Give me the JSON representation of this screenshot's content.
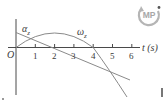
{
  "figure": {
    "origin_label": "O",
    "x_axis_label": "t (s)",
    "x_ticks": [
      "1",
      "2",
      "3",
      "4",
      "5",
      "6"
    ],
    "curve_labels": {
      "alpha": "αz",
      "omega": "ωz"
    },
    "badge": {
      "icon": "mastering-physics-badge-icon",
      "text": "MP"
    },
    "colors": {
      "axes": "#4a4a4a",
      "curves": "#8a8a8a",
      "badge": "#a8a8a8"
    }
  },
  "chart_data": {
    "type": "line",
    "title": "",
    "xlabel": "t (s)",
    "ylabel": "",
    "xlim": [
      0,
      6.5
    ],
    "grid": false,
    "x_ticks": [
      1,
      2,
      3,
      4,
      5,
      6
    ],
    "series": [
      {
        "name": "αz",
        "shape": "straight line, decreasing",
        "x": [
          0,
          2.2,
          6
        ],
        "values": [
          1,
          0,
          -2.4
        ],
        "note": "relative units; crosses t-axis near t≈2.2 s"
      },
      {
        "name": "ωz",
        "shape": "parabola opening downward",
        "x": [
          0,
          1,
          2,
          3,
          4,
          5,
          6
        ],
        "values": [
          0,
          0.75,
          1,
          0.75,
          0,
          -1.25,
          -3
        ],
        "note": "relative units; zero at t=0 and t=4 s, maximum at t=2 s"
      }
    ],
    "annotations": [
      "O at origin",
      "αz label near t≈0.8",
      "ωz label near t≈3.3"
    ]
  }
}
